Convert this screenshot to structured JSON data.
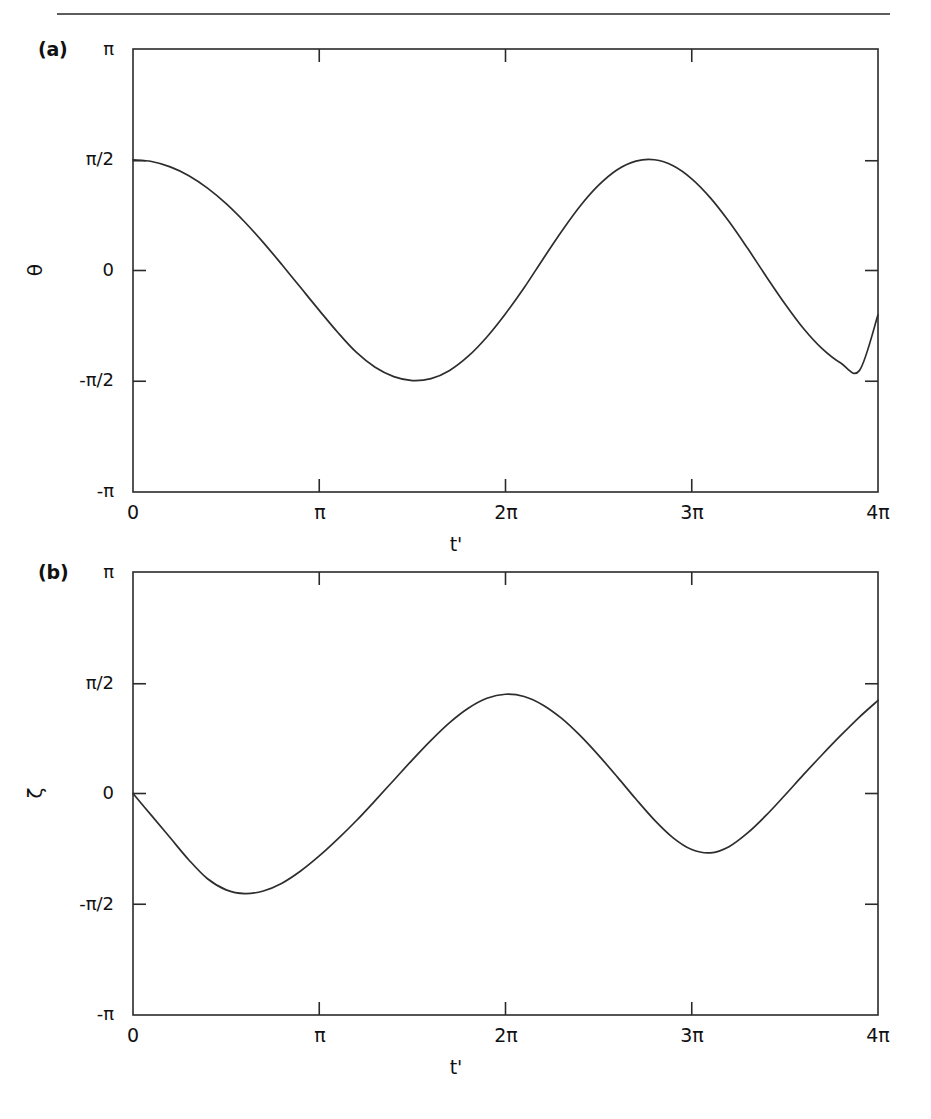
{
  "figure": {
    "divider": "horizontal-rule",
    "stroke_color": "#2d2d2d",
    "background_color": "#ffffff"
  },
  "panels": [
    {
      "label": "(a)",
      "ylabel": "θ",
      "xlabel": "t'"
    },
    {
      "label": "(b)",
      "ylabel": "ζ",
      "xlabel": "t'"
    }
  ],
  "axis": {
    "y_ticks": [
      "π",
      "π/2",
      "0",
      "-π/2",
      "-π"
    ],
    "x_ticks": [
      "0",
      "π",
      "2π",
      "3π",
      "4π"
    ]
  },
  "chart_data": [
    {
      "type": "line",
      "title": "(a)",
      "xlabel": "t'",
      "ylabel": "θ",
      "xlim": [
        0,
        4
      ],
      "ylim": [
        -1,
        1
      ],
      "xunit": "π",
      "yunit": "π",
      "xtick_values": [
        0,
        1,
        2,
        3,
        4
      ],
      "xtick_labels": [
        "0",
        "π",
        "2π",
        "3π",
        "4π"
      ],
      "ytick_values": [
        1,
        0.5,
        0,
        -0.5,
        -1
      ],
      "ytick_labels": [
        "π",
        "π/2",
        "0",
        "-π/2",
        "-π"
      ],
      "grid": false,
      "legend": false,
      "series": [
        {
          "name": "theta",
          "x": [
            0,
            0.1,
            0.2,
            0.3,
            0.4,
            0.5,
            0.6,
            0.7,
            0.8,
            0.9,
            1.0,
            1.1,
            1.2,
            1.3,
            1.4,
            1.5,
            1.6,
            1.7,
            1.8,
            1.9,
            2.0,
            2.1,
            2.2,
            2.3,
            2.4,
            2.5,
            2.6,
            2.7,
            2.8,
            2.9,
            3.0,
            3.1,
            3.2,
            3.3,
            3.4,
            3.5,
            3.6,
            3.7,
            3.8,
            3.9,
            4.0
          ],
          "y": [
            0.5,
            0.492,
            0.468,
            0.428,
            0.372,
            0.302,
            0.219,
            0.126,
            0.026,
            -0.077,
            -0.18,
            -0.28,
            -0.37,
            -0.437,
            -0.479,
            -0.497,
            -0.488,
            -0.451,
            -0.387,
            -0.3,
            -0.195,
            -0.078,
            0.05,
            0.175,
            0.29,
            0.385,
            0.455,
            0.494,
            0.5,
            0.473,
            0.414,
            0.328,
            0.221,
            0.1,
            -0.027,
            -0.15,
            -0.262,
            -0.353,
            -0.418,
            -0.452,
            -0.2
          ]
        }
      ]
    },
    {
      "type": "line",
      "title": "(b)",
      "xlabel": "t'",
      "ylabel": "ζ",
      "xlim": [
        0,
        4
      ],
      "ylim": [
        -1,
        1
      ],
      "xunit": "π",
      "yunit": "π",
      "xtick_values": [
        0,
        1,
        2,
        3,
        4
      ],
      "xtick_labels": [
        "0",
        "π",
        "2π",
        "3π",
        "4π"
      ],
      "ytick_values": [
        1,
        0.5,
        0,
        -0.5,
        -1
      ],
      "ytick_labels": [
        "π",
        "π/2",
        "0",
        "-π/2",
        "-π"
      ],
      "grid": false,
      "legend": false,
      "series": [
        {
          "name": "zeta",
          "x": [
            0,
            0.1,
            0.2,
            0.3,
            0.4,
            0.5,
            0.6,
            0.7,
            0.8,
            0.9,
            1.0,
            1.1,
            1.2,
            1.3,
            1.4,
            1.5,
            1.6,
            1.7,
            1.8,
            1.9,
            2.0,
            2.1,
            2.2,
            2.3,
            2.4,
            2.5,
            2.6,
            2.7,
            2.8,
            2.9,
            3.0,
            3.1,
            3.2,
            3.3,
            3.4,
            3.5,
            3.6,
            3.7,
            3.8,
            3.9,
            4.0
          ],
          "y": [
            0,
            -0.1,
            -0.2,
            -0.3,
            -0.385,
            -0.435,
            -0.452,
            -0.44,
            -0.405,
            -0.35,
            -0.282,
            -0.205,
            -0.122,
            -0.032,
            0.06,
            0.152,
            0.24,
            0.32,
            0.385,
            0.43,
            0.448,
            0.438,
            0.4,
            0.34,
            0.262,
            0.172,
            0.075,
            -0.025,
            -0.12,
            -0.2,
            -0.253,
            -0.268,
            -0.24,
            -0.178,
            -0.098,
            -0.008,
            0.085,
            0.175,
            0.262,
            0.345,
            0.42
          ]
        }
      ]
    }
  ]
}
